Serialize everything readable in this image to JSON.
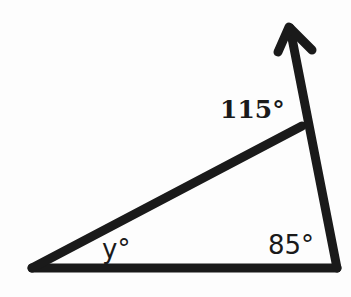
{
  "diagram": {
    "type": "triangle with exterior angle",
    "labels": {
      "exterior_angle": "115°",
      "angle_y": "y°",
      "angle_right": "85°"
    },
    "colors": {
      "stroke": "#1a1a1a",
      "background": "#fdfdfd"
    }
  }
}
